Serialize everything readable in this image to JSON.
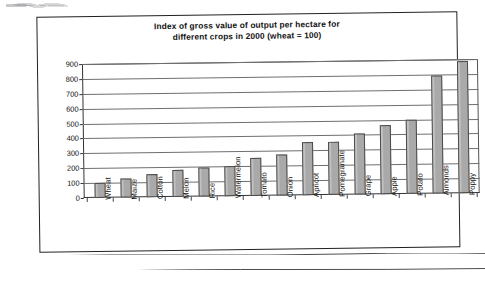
{
  "chart_data": {
    "type": "bar",
    "title": "Index of gross value of output per hectare for different crops in 2000 (wheat = 100)",
    "title_lines": [
      "Index of gross value of output per hectare for",
      "different crops in 2000 (wheat = 100)"
    ],
    "xlabel": "",
    "ylabel": "",
    "ylim": [
      0,
      900
    ],
    "ytick_step": 100,
    "yticks": [
      900,
      800,
      700,
      600,
      500,
      400,
      300,
      200,
      100,
      0
    ],
    "ytick_labels": [
      "900",
      "800",
      "700",
      "600",
      "500",
      "400",
      "300",
      "200",
      "100",
      "0"
    ],
    "grid": true,
    "grid_axis": "y",
    "legend": false,
    "legend_position": "none",
    "bar_fill_color": "#a9a9a9",
    "bar_border_color": "#4a4a4a",
    "categories": [
      "Wheat",
      "Maize",
      "Cotton",
      "Melon",
      "Rice",
      "Watermelon",
      "Tomato",
      "Onion",
      "Apricot",
      "Pomegranate",
      "Grape",
      "Apple",
      "Potato",
      "Almonds",
      "Poppy"
    ],
    "values": [
      100,
      125,
      155,
      180,
      197,
      200,
      252,
      278,
      353,
      358,
      413,
      463,
      497,
      795,
      885
    ],
    "series": [
      {
        "name": "Index of gross value of output per hectare",
        "values": [
          100,
          125,
          155,
          180,
          197,
          200,
          252,
          278,
          353,
          358,
          413,
          463,
          497,
          795,
          885
        ]
      }
    ]
  },
  "page": {
    "background_color": "#ffffff",
    "frame_color": "#222222"
  }
}
